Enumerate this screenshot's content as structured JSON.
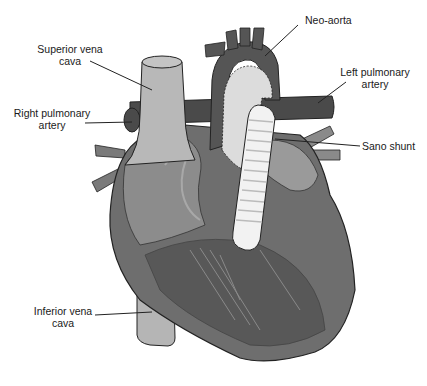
{
  "figure": {
    "colors": {
      "background": "#ffffff",
      "heart_body": "#6e6e6e",
      "heart_dark": "#555555",
      "vessel_light": "#b8b8b8",
      "vessel_dark": "#4a4a4a",
      "neo_aorta_patch": "#dcdcdc",
      "shunt": "#f2f2f2",
      "outline": "#222222"
    }
  },
  "labels": {
    "superior_vena_cava": {
      "line1": "Superior vena",
      "line2": "cava"
    },
    "right_pulmonary_artery": {
      "line1": "Right pulmonary",
      "line2": "artery"
    },
    "neo_aorta": {
      "line1": "Neo-aorta"
    },
    "left_pulmonary_artery": {
      "line1": "Left pulmonary",
      "line2": "artery"
    },
    "sano_shunt": {
      "line1": "Sano shunt"
    },
    "inferior_vena_cava": {
      "line1": "Inferior vena",
      "line2": "cava"
    }
  }
}
